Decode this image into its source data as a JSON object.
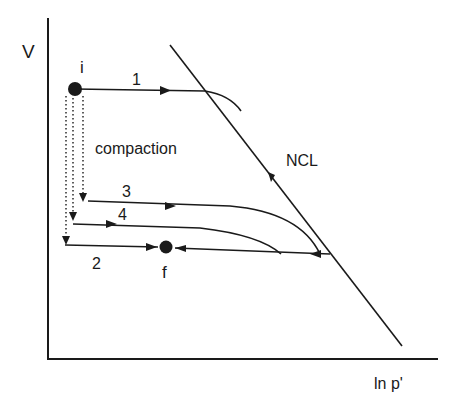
{
  "axes": {
    "y_label": "V",
    "x_label": "ln p'"
  },
  "points": {
    "initial": "i",
    "final": "f"
  },
  "lines": {
    "ncl_label": "NCL"
  },
  "paths": [
    {
      "id": "1",
      "label": "1"
    },
    {
      "id": "2",
      "label": "2"
    },
    {
      "id": "3",
      "label": "3"
    },
    {
      "id": "4",
      "label": "4"
    }
  ],
  "annotations": {
    "compaction": "compaction"
  },
  "colors": {
    "ink": "#1a1a1a",
    "background": "#ffffff"
  }
}
